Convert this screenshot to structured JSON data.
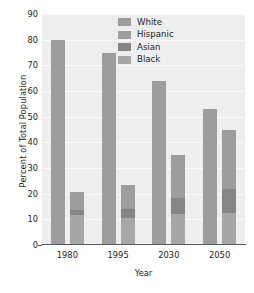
{
  "chart_data": {
    "type": "bar",
    "title": "",
    "subtitle": "",
    "xlabel": "Year",
    "ylabel": "Percent of Total Population",
    "categories": [
      "1980",
      "1995",
      "2030",
      "2050"
    ],
    "ylim": [
      0,
      90
    ],
    "yticks": [
      0,
      10,
      20,
      30,
      40,
      50,
      60,
      70,
      80,
      90
    ],
    "grid": true,
    "legend_position": "top-right",
    "legend": [
      "White",
      "Hispanic",
      "Asian",
      "Black"
    ],
    "series": [
      {
        "name": "White",
        "color": "#9d9d9d",
        "values": [
          80.0,
          75.0,
          64.0,
          53.0
        ]
      },
      {
        "name": "Black",
        "color": "#a6a6a6",
        "values": [
          11.5,
          10.5,
          12.0,
          12.5
        ]
      },
      {
        "name": "Asian",
        "color": "#858585",
        "values": [
          2.0,
          3.5,
          6.5,
          9.5
        ]
      },
      {
        "name": "Hispanic",
        "color": "#9d9d9d",
        "values": [
          7.0,
          9.5,
          16.5,
          23.0
        ]
      }
    ],
    "minority_totals": [
      20.5,
      23.5,
      35.0,
      45.0
    ]
  },
  "colors": {
    "plot_background": "#eeeeee",
    "gridline": "#fbfbfb",
    "axis": "#58595b",
    "text": "#231f20",
    "white_series": "#9d9d9d",
    "hispanic_series": "#9d9d9d",
    "asian_series": "#858585",
    "black_series": "#a6a6a6"
  }
}
